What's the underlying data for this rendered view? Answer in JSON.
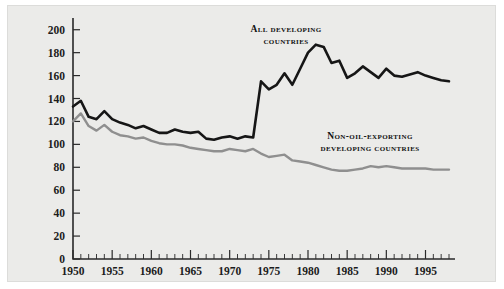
{
  "figure": {
    "background_color": "#ebebe9",
    "border_color": "#dcdcda",
    "page_background": "#ffffff"
  },
  "annotations": {
    "all_developing_line1": "All developing",
    "all_developing_line2": "countries",
    "non_oil_line1": "Non-oil-exporting",
    "non_oil_line2": "developing countries"
  },
  "chart_data": {
    "type": "line",
    "title": "",
    "subtitle": "",
    "xlabel": "",
    "ylabel": "",
    "xlim": [
      1950,
      1998
    ],
    "ylim": [
      0,
      205
    ],
    "y_ticks": [
      0,
      20,
      40,
      60,
      80,
      100,
      120,
      140,
      160,
      180,
      200
    ],
    "x_ticks_major": [
      1950,
      1955,
      1960,
      1965,
      1970,
      1975,
      1980,
      1985,
      1990,
      1995
    ],
    "x_ticks_minor_step": 1,
    "grid": false,
    "legend_position": "inline-annotations",
    "x": [
      1950,
      1951,
      1952,
      1953,
      1954,
      1955,
      1956,
      1957,
      1958,
      1959,
      1960,
      1961,
      1962,
      1963,
      1964,
      1965,
      1966,
      1967,
      1968,
      1969,
      1970,
      1971,
      1972,
      1973,
      1974,
      1975,
      1976,
      1977,
      1978,
      1979,
      1980,
      1981,
      1982,
      1983,
      1984,
      1985,
      1986,
      1987,
      1988,
      1989,
      1990,
      1991,
      1992,
      1993,
      1994,
      1995,
      1996,
      1997,
      1998
    ],
    "series": [
      {
        "name": "All developing countries",
        "color": "#161616",
        "values": [
          133,
          138,
          124,
          122,
          129,
          122,
          119,
          117,
          114,
          116,
          113,
          110,
          110,
          113,
          111,
          110,
          111,
          105,
          104,
          106,
          107,
          105,
          107,
          106,
          155,
          148,
          152,
          162,
          152,
          166,
          180,
          187,
          185,
          171,
          173,
          158,
          162,
          168,
          163,
          158,
          166,
          160,
          159,
          161,
          163,
          160,
          158,
          156,
          155
        ]
      },
      {
        "name": "Non-oil-exporting developing countries",
        "color": "#8f8f8f",
        "values": [
          120,
          127,
          116,
          112,
          117,
          111,
          108,
          107,
          105,
          106,
          103,
          101,
          100,
          100,
          99,
          97,
          96,
          95,
          94,
          94,
          96,
          95,
          94,
          96,
          92,
          89,
          90,
          91,
          86,
          85,
          84,
          82,
          80,
          78,
          77,
          77,
          78,
          79,
          81,
          80,
          81,
          80,
          79,
          79,
          79,
          79,
          78,
          78,
          78
        ]
      }
    ]
  }
}
